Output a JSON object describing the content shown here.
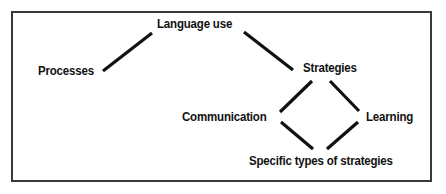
{
  "diagram": {
    "type": "concept-map",
    "background_color": "#ffffff",
    "frame_color": "#3a3a3a",
    "line_color": "#111111",
    "text_color": "#111111",
    "nodes": [
      {
        "id": "language_use",
        "label": "Language use"
      },
      {
        "id": "processes",
        "label": "Processes"
      },
      {
        "id": "strategies",
        "label": "Strategies"
      },
      {
        "id": "communication",
        "label": "Communication"
      },
      {
        "id": "learning",
        "label": "Learning"
      },
      {
        "id": "specific_types",
        "label": "Specific types of strategies"
      }
    ],
    "edges": [
      {
        "from": "processes",
        "to": "language_use",
        "x1": 103,
        "y1": 71,
        "x2": 152,
        "y2": 33
      },
      {
        "from": "language_use",
        "to": "strategies",
        "x1": 244,
        "y1": 32,
        "x2": 293,
        "y2": 70
      },
      {
        "from": "strategies",
        "to": "communication",
        "x1": 312,
        "y1": 81,
        "x2": 280,
        "y2": 112
      },
      {
        "from": "strategies",
        "to": "learning",
        "x1": 330,
        "y1": 81,
        "x2": 359,
        "y2": 111
      },
      {
        "from": "communication",
        "to": "specific_types",
        "x1": 281,
        "y1": 122,
        "x2": 313,
        "y2": 149
      },
      {
        "from": "learning",
        "to": "specific_types",
        "x1": 358,
        "y1": 122,
        "x2": 327,
        "y2": 149
      }
    ]
  }
}
